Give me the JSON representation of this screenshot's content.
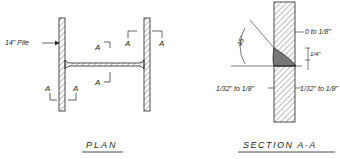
{
  "plan": {
    "title": "PLAN",
    "pile_label": "14\" Pile",
    "section_marks": [
      "A",
      "A",
      "A",
      "A",
      "A",
      "A"
    ]
  },
  "section": {
    "title": "SECTION A-A",
    "angle": "45°",
    "gap_top": "0 to 1/8\"",
    "weld_size": "1/4\"",
    "left_dim": "1/32\" to 1/8\"",
    "right_dim": "1/32\" to 1/8\"",
    "dim_frac_num": "1\"",
    "dim_frac_den_left": "32",
    "dim_frac_den_right": "8"
  },
  "colors": {
    "ink": "#222222",
    "hatch": "#555555",
    "weld": "#777777"
  }
}
